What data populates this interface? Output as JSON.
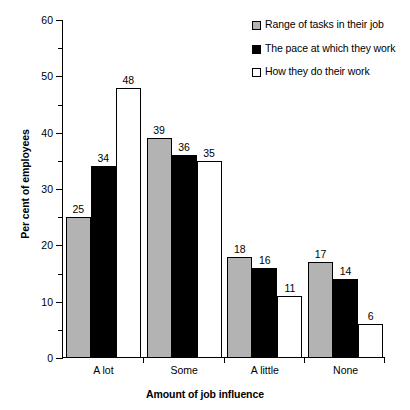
{
  "chart_data": {
    "type": "bar",
    "title": "",
    "xlabel": "Amount of job influence",
    "ylabel": "Per cent of employees",
    "categories": [
      "A lot",
      "Some",
      "A little",
      "None"
    ],
    "series": [
      {
        "name": "Range of tasks in their job",
        "color": "#b3b3b3",
        "values": [
          25,
          39,
          18,
          17
        ]
      },
      {
        "name": "The pace at which they work",
        "color": "#000000",
        "values": [
          34,
          36,
          16,
          14
        ]
      },
      {
        "name": "How they do their work",
        "color": "#ffffff",
        "values": [
          48,
          35,
          11,
          6
        ]
      }
    ],
    "ylim": [
      0,
      60
    ],
    "yticks": [
      0,
      10,
      20,
      30,
      40,
      50,
      60
    ],
    "yminorticks": [
      5,
      15,
      25,
      35,
      45,
      55
    ],
    "grid": false,
    "legend_position": "top-right",
    "value_labels": true
  },
  "legend": {
    "items": [
      {
        "label": "Range of tasks in their job",
        "swatch": "gray-square-icon"
      },
      {
        "label": "The pace at which they work",
        "swatch": "black-square-icon"
      },
      {
        "label": "How they do their work",
        "swatch": "white-square-icon"
      }
    ]
  }
}
